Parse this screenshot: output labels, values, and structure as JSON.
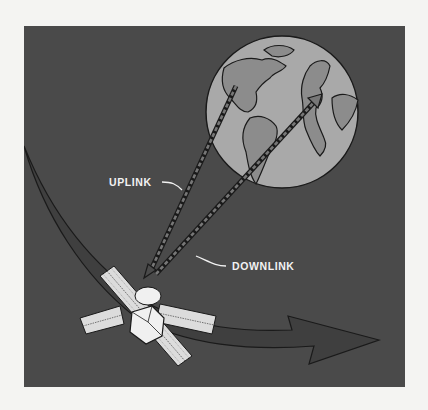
{
  "diagram": {
    "labels": {
      "uplink": "UPLINK",
      "downlink": "DOWNLINK"
    },
    "elements": [
      {
        "name": "earth-globe",
        "type": "globe"
      },
      {
        "name": "satellite",
        "type": "spacecraft"
      },
      {
        "name": "orbit-path-arrow",
        "type": "arrow"
      },
      {
        "name": "uplink-beam",
        "type": "dashed-arrow",
        "direction": "earth-to-satellite"
      },
      {
        "name": "downlink-beam",
        "type": "dashed-arrow",
        "direction": "satellite-to-earth"
      }
    ],
    "colors": {
      "page_background": "#f4f4f2",
      "space_background": "#4a4a4a",
      "globe_ocean": "#a9a9a9",
      "globe_land": "#8c8c8c",
      "orbit_arrow": "#3f3f3f",
      "satellite_body": "#f0f0f0",
      "label_text": "#f2f2f2"
    }
  }
}
